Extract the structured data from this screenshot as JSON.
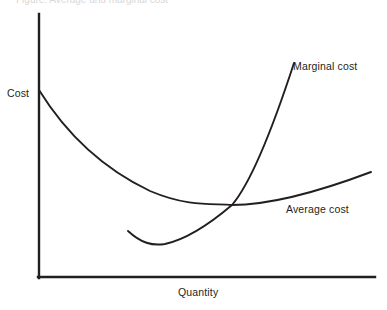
{
  "figure": {
    "background_color": "#ffffff",
    "ink_color": "#231f20",
    "width": 387,
    "height": 310
  },
  "axes": {
    "y_axis_label": "Cost",
    "x_axis_label": "Quantity",
    "origin": {
      "x": 38,
      "y": 278
    },
    "y_axis_top": {
      "x": 38,
      "y": 14
    },
    "x_axis_right": {
      "x": 375,
      "y": 278
    }
  },
  "labels": {
    "marginal_cost": "Marginal cost",
    "average_cost": "Average cost"
  },
  "top_caption": {
    "text": "Figure: Average and marginal cost"
  },
  "chart_data": {
    "type": "line",
    "title": "",
    "subtitle": "",
    "xlabel": "Quantity",
    "ylabel": "Cost",
    "grid": false,
    "legend": "inline-annotations",
    "axis_ranges": {
      "x_pixels": [
        38,
        375
      ],
      "y_pixels": [
        14,
        278
      ]
    },
    "annotations": [
      {
        "text": "Cost",
        "role": "y-axis-title",
        "x": 7,
        "y": 93
      },
      {
        "text": "Quantity",
        "role": "x-axis-title",
        "x": 178,
        "y": 292
      },
      {
        "text": "Marginal cost",
        "role": "series-label",
        "x": 293,
        "y": 66
      },
      {
        "text": "Average cost",
        "role": "series-label",
        "x": 286,
        "y": 209
      }
    ],
    "intersection": {
      "description": "Marginal cost crosses Average cost at the minimum of Average cost",
      "x": 232,
      "y": 205
    },
    "series": [
      {
        "name": "Average cost",
        "shape": "U-shaped, steeply falling then gently rising",
        "path": "M 39 90 C 70 140, 110 172, 150 191 C 190 208, 215 203, 232 205 C 265 205, 310 195, 371 172",
        "points": [
          {
            "x": 39,
            "y": 90
          },
          {
            "x": 70,
            "y": 134
          },
          {
            "x": 100,
            "y": 159
          },
          {
            "x": 130,
            "y": 178
          },
          {
            "x": 160,
            "y": 192
          },
          {
            "x": 190,
            "y": 200
          },
          {
            "x": 215,
            "y": 204
          },
          {
            "x": 232,
            "y": 205
          },
          {
            "x": 260,
            "y": 204
          },
          {
            "x": 300,
            "y": 196
          },
          {
            "x": 340,
            "y": 184
          },
          {
            "x": 371,
            "y": 172
          }
        ]
      },
      {
        "name": "Marginal cost",
        "shape": "U-shaped, shallow dip then steeply rising",
        "path": "M 128 231 C 141 243, 152 246, 165 244 C 188 239, 212 222, 232 205 C 255 178, 278 112, 294 63",
        "points": [
          {
            "x": 128,
            "y": 231
          },
          {
            "x": 145,
            "y": 243
          },
          {
            "x": 160,
            "y": 245
          },
          {
            "x": 180,
            "y": 239
          },
          {
            "x": 200,
            "y": 227
          },
          {
            "x": 232,
            "y": 205
          },
          {
            "x": 250,
            "y": 184
          },
          {
            "x": 268,
            "y": 148
          },
          {
            "x": 282,
            "y": 108
          },
          {
            "x": 294,
            "y": 63
          }
        ]
      }
    ]
  }
}
